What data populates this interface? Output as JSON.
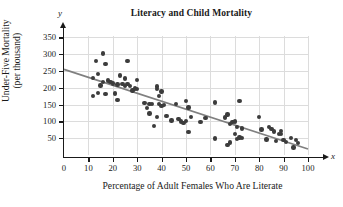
{
  "chart_data": {
    "type": "scatter",
    "title": "Literacy and Child Mortality",
    "xlabel": "Percentage of Adult Females Who Are Literate",
    "ylabel_line1": "Under-Five Mortality",
    "ylabel_line2": "(per thousand)",
    "x_symbol": "x",
    "y_symbol": "y",
    "xlim": [
      0,
      100
    ],
    "ylim": [
      0,
      365
    ],
    "xticks": [
      0,
      10,
      20,
      30,
      40,
      50,
      60,
      70,
      80,
      90,
      100
    ],
    "yticks": [
      50,
      100,
      150,
      200,
      250,
      300,
      350
    ],
    "grid": true,
    "legend": "none",
    "point_color": "#3c3c3c",
    "line_color": "#808080",
    "grid_color": "#dcdcdc",
    "axis_color": "#1a1a1a",
    "trend_line": {
      "x_start": 0,
      "y_start": 255,
      "x_end": 100,
      "y_end": 18
    },
    "points": [
      [
        12,
        230
      ],
      [
        12,
        175
      ],
      [
        13,
        280
      ],
      [
        14,
        242
      ],
      [
        14,
        185
      ],
      [
        15,
        207
      ],
      [
        16,
        302
      ],
      [
        16,
        218
      ],
      [
        17,
        182
      ],
      [
        17,
        270
      ],
      [
        18,
        222
      ],
      [
        19,
        218
      ],
      [
        20,
        213
      ],
      [
        21,
        183
      ],
      [
        22,
        210
      ],
      [
        22,
        163
      ],
      [
        23,
        237
      ],
      [
        24,
        212
      ],
      [
        25,
        205
      ],
      [
        25,
        228
      ],
      [
        26,
        279
      ],
      [
        26,
        212
      ],
      [
        27,
        206
      ],
      [
        28,
        192
      ],
      [
        29,
        198
      ],
      [
        30,
        224
      ],
      [
        30,
        196
      ],
      [
        33,
        155
      ],
      [
        34,
        140
      ],
      [
        35,
        124
      ],
      [
        35,
        152
      ],
      [
        36,
        151
      ],
      [
        37,
        86
      ],
      [
        38,
        204
      ],
      [
        38,
        197
      ],
      [
        38,
        113
      ],
      [
        39,
        175
      ],
      [
        39,
        152
      ],
      [
        40,
        189
      ],
      [
        40,
        146
      ],
      [
        41,
        148
      ],
      [
        42,
        116
      ],
      [
        44,
        103
      ],
      [
        46,
        152
      ],
      [
        47,
        107
      ],
      [
        48,
        100
      ],
      [
        49,
        96
      ],
      [
        50,
        160
      ],
      [
        50,
        101
      ],
      [
        51,
        68
      ],
      [
        51,
        141
      ],
      [
        52,
        114
      ],
      [
        56,
        98
      ],
      [
        58,
        111
      ],
      [
        62,
        156
      ],
      [
        62,
        49
      ],
      [
        66,
        112
      ],
      [
        67,
        30
      ],
      [
        67,
        120
      ],
      [
        68,
        92
      ],
      [
        68,
        37
      ],
      [
        69,
        98
      ],
      [
        70,
        100
      ],
      [
        70,
        62
      ],
      [
        71,
        47
      ],
      [
        71,
        84
      ],
      [
        72,
        161
      ],
      [
        72,
        52
      ],
      [
        73,
        79
      ],
      [
        73,
        50
      ],
      [
        80,
        113
      ],
      [
        81,
        76
      ],
      [
        83,
        46
      ],
      [
        84,
        84
      ],
      [
        85,
        78
      ],
      [
        86,
        70
      ],
      [
        87,
        41
      ],
      [
        88,
        62
      ],
      [
        89,
        63
      ],
      [
        89,
        71
      ],
      [
        90,
        45
      ],
      [
        91,
        38
      ],
      [
        93,
        50
      ],
      [
        94,
        22
      ],
      [
        95,
        45
      ],
      [
        96,
        35
      ]
    ]
  }
}
